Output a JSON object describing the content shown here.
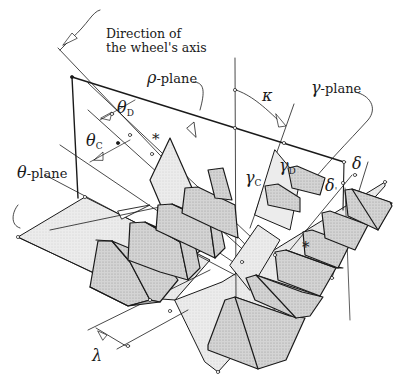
{
  "diagram": {
    "colors": {
      "line": "#1a1a1a",
      "shade_light": "#e6e6e6",
      "shade_mid": "#c8c8c8",
      "shade_dark": "#a9a9a9",
      "background": "#ffffff"
    },
    "labels": {
      "wheel_axis": [
        "Direction of",
        "the wheel's axis"
      ],
      "rho_plane": {
        "symbol": "ρ",
        "text": "-plane"
      },
      "gamma_plane": {
        "symbol": "γ",
        "text": "-plane"
      },
      "theta_plane": {
        "symbol": "θ",
        "text": "-plane"
      },
      "theta_D": {
        "symbol": "θ",
        "sub": "D"
      },
      "theta_C": {
        "symbol": "θ",
        "sub": "C"
      },
      "gamma_C": {
        "symbol": "γ",
        "sub": "C"
      },
      "gamma_D": {
        "symbol": "γ",
        "sub": "D"
      },
      "kappa": {
        "symbol": "κ"
      },
      "delta_1": {
        "symbol": "δ"
      },
      "delta_2": {
        "symbol": "δ",
        "sub": "'"
      },
      "lambda": {
        "symbol": "λ"
      },
      "asterisk_1": "*",
      "asterisk_2": "*"
    }
  }
}
